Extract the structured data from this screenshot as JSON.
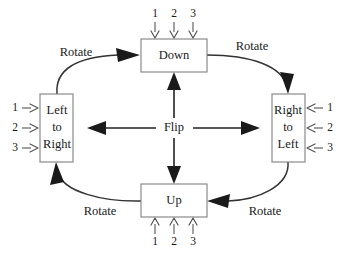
{
  "diagram": {
    "background_color": "#ffffff",
    "line_color": "#333333",
    "box_stroke_color": "#808080",
    "text_color": "#1a1a1a",
    "nodes": [
      {
        "id": "down",
        "label": "Down",
        "position": "top",
        "ports_side": "top",
        "ports": [
          "1",
          "2",
          "3"
        ],
        "port_direction": "into-box-downward"
      },
      {
        "id": "left-to-right",
        "label_lines": [
          "Left",
          "to",
          "Right"
        ],
        "label": "Left to Right",
        "position": "left",
        "ports_side": "left",
        "ports": [
          "1",
          "2",
          "3"
        ],
        "port_direction": "into-box-rightward"
      },
      {
        "id": "right-to-left",
        "label_lines": [
          "Right",
          "to",
          "Left"
        ],
        "label": "Right to Left",
        "position": "right",
        "ports_side": "right",
        "ports": [
          "1",
          "2",
          "3"
        ],
        "port_direction": "into-box-leftward"
      },
      {
        "id": "up",
        "label": "Up",
        "position": "bottom",
        "ports_side": "bottom",
        "ports": [
          "1",
          "2",
          "3"
        ],
        "port_direction": "into-box-upward"
      }
    ],
    "center_label": "Flip",
    "flip_edges": [
      {
        "id": "flip-up",
        "label": "Flip",
        "from": "center",
        "to": "down"
      },
      {
        "id": "flip-down",
        "label": "Flip",
        "from": "center",
        "to": "up"
      },
      {
        "id": "flip-left",
        "label": "Flip",
        "from": "center",
        "to": "left-to-right"
      },
      {
        "id": "flip-right",
        "label": "Flip",
        "from": "center",
        "to": "right-to-left"
      }
    ],
    "rotate_edges": [
      {
        "id": "rotate-top-left",
        "label": "Rotate",
        "from": "left-to-right",
        "to": "down"
      },
      {
        "id": "rotate-top-right",
        "label": "Rotate",
        "from": "down",
        "to": "right-to-left"
      },
      {
        "id": "rotate-bottom-right",
        "label": "Rotate",
        "from": "right-to-left",
        "to": "up"
      },
      {
        "id": "rotate-bottom-left",
        "label": "Rotate",
        "from": "up",
        "to": "left-to-right"
      }
    ]
  }
}
